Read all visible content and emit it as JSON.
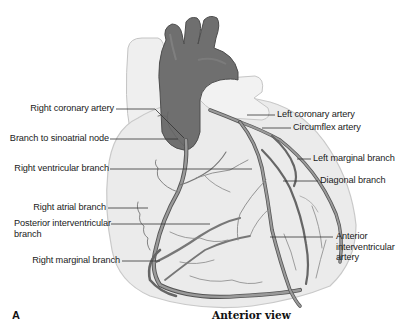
{
  "figure": {
    "panel_letter": "A",
    "caption": "Anterior view",
    "colors": {
      "heart_fill": "#ececec",
      "heart_outline": "#c8c8c8",
      "aorta": "#6e6e6e",
      "artery": "#8a8a8a",
      "artery_edge": "#555555",
      "leader_line": "#333333",
      "label_text": "#1a1a1a"
    },
    "labels_left": [
      {
        "text": "Right coronary artery"
      },
      {
        "text": "Branch to sinoatrial node"
      },
      {
        "text": "Right ventricular branch"
      },
      {
        "text": "Right atrial branch"
      },
      {
        "text": "Posterior interventricular branch"
      },
      {
        "text": "Right marginal branch"
      }
    ],
    "labels_right": [
      {
        "text": "Left coronary artery"
      },
      {
        "text": "Circumflex artery"
      },
      {
        "text": "Left marginal branch"
      },
      {
        "text": "Diagonal branch"
      },
      {
        "text": "Anterior interventricular artery"
      }
    ]
  }
}
